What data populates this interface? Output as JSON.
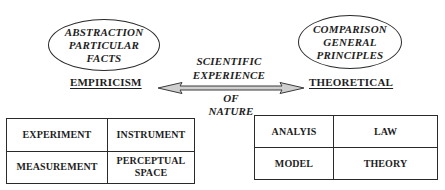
{
  "diagram": {
    "empiricism": {
      "ellipse_lines": [
        "ABSTRACTION",
        "PARTICULAR",
        "FACTS"
      ],
      "heading": "EMPIRICISM",
      "table": [
        [
          {
            "lines": [
              "EXPERIMENT"
            ]
          },
          {
            "lines": [
              "INSTRUMENT"
            ]
          }
        ],
        [
          {
            "lines": [
              "MEASUREMENT"
            ]
          },
          {
            "lines": [
              "PERCEPTUAL",
              "SPACE"
            ]
          }
        ]
      ]
    },
    "theoretical": {
      "ellipse_lines": [
        "COMPARISON",
        "GENERAL",
        "PRINCIPLES"
      ],
      "heading": "THEORETICAL",
      "table": [
        [
          {
            "lines": [
              "ANALYIS"
            ]
          },
          {
            "lines": [
              "LAW"
            ]
          }
        ],
        [
          {
            "lines": [
              "MODEL"
            ]
          },
          {
            "lines": [
              "THEORY"
            ]
          }
        ]
      ]
    },
    "center": {
      "above_arrow": [
        "SCIENTIFIC",
        "EXPERIENCE"
      ],
      "below_arrow": [
        "OF",
        "NATURE"
      ],
      "arrow": {
        "type": "double-headed",
        "fill_color": "#cfcfcf",
        "stroke_color": "#3a3a3a"
      }
    }
  }
}
